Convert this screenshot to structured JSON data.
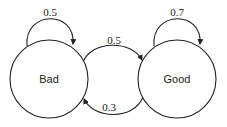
{
  "diagram": {
    "type": "state-transition",
    "nodes": [
      {
        "id": "bad",
        "label": "Bad"
      },
      {
        "id": "good",
        "label": "Good"
      }
    ],
    "edges": [
      {
        "from": "bad",
        "to": "bad",
        "label": "0.5"
      },
      {
        "from": "bad",
        "to": "good",
        "label": "0.5"
      },
      {
        "from": "good",
        "to": "bad",
        "label": "0.3"
      },
      {
        "from": "good",
        "to": "good",
        "label": "0.7"
      }
    ]
  }
}
